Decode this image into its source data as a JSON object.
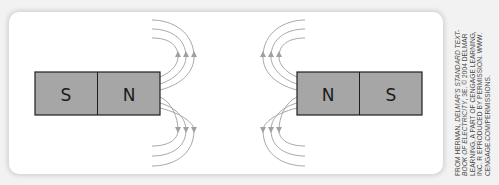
{
  "figure": {
    "left_magnet": {
      "left_pole": "S",
      "right_pole": "N"
    },
    "right_magnet": {
      "left_pole": "N",
      "right_pole": "S"
    },
    "colors": {
      "magnet_fill": "#a6a6a6",
      "magnet_stroke": "#1e1e1e",
      "field_line": "#a8a8a8",
      "panel": "#ffffff",
      "background": "#f2f2f2"
    },
    "field_lines_per_side": 3
  },
  "caption": {
    "lines": [
      {
        "plain": "FROM HERMAN, ",
        "italic": "DELMAR'S STANDARD TEXT-"
      },
      {
        "italic": "BOOK OF ELECTRICITY",
        "plain": ", 3E. © 2004 DELMAR"
      },
      {
        "plain": "LEARNING, A PART OF CENGAGE LEARNING,"
      },
      {
        "plain": "INC. R EPRODUCED BY PERMISSION. WWW."
      },
      {
        "plain": "CENGAGE.COM/PERMISSIONS."
      }
    ]
  }
}
